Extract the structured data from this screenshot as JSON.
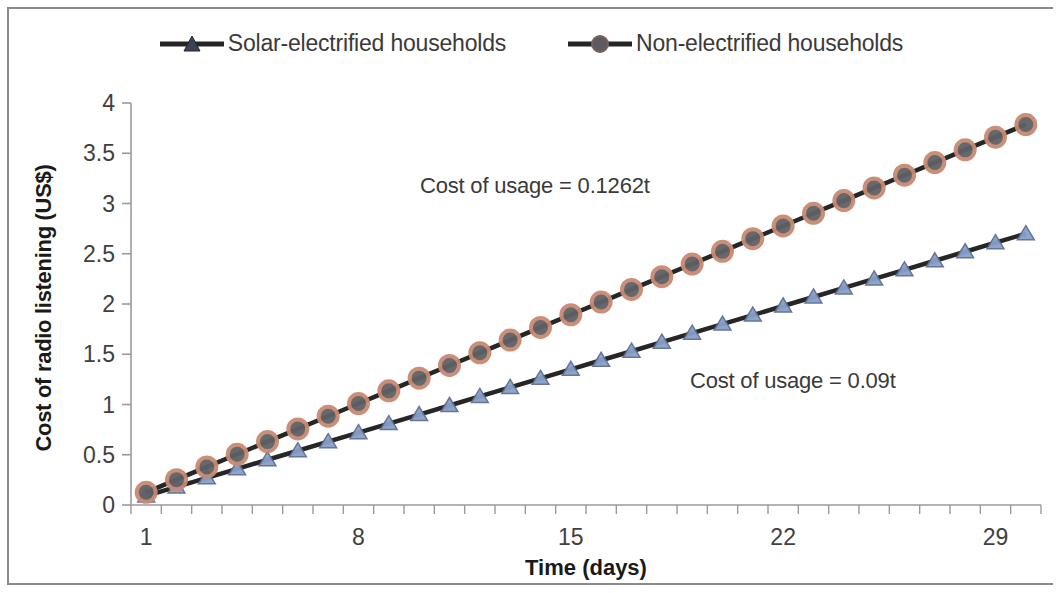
{
  "chart_data": {
    "type": "line",
    "title": "",
    "xlabel": "Time (days)",
    "ylabel": "Cost of radio listening (US$)",
    "xlim": [
      1,
      30
    ],
    "ylim": [
      0,
      4
    ],
    "ytick_step": 0.5,
    "yticks": [
      "0",
      "0.5",
      "1",
      "1.5",
      "2",
      "2.5",
      "3",
      "3.5",
      "4"
    ],
    "xticks_major": [
      "1",
      "8",
      "15",
      "22",
      "29"
    ],
    "x": [
      1,
      2,
      3,
      4,
      5,
      6,
      7,
      8,
      9,
      10,
      11,
      12,
      13,
      14,
      15,
      16,
      17,
      18,
      19,
      20,
      21,
      22,
      23,
      24,
      25,
      26,
      27,
      28,
      29,
      30
    ],
    "grid": false,
    "legend_position": "top",
    "series": [
      {
        "name": "Solar-electrified households",
        "marker": "triangle",
        "marker_color": "#8aa0c8",
        "line_color": "#262626",
        "slope": 0.09,
        "values": [
          0.09,
          0.18,
          0.27,
          0.36,
          0.45,
          0.54,
          0.63,
          0.72,
          0.81,
          0.9,
          0.99,
          1.08,
          1.17,
          1.26,
          1.35,
          1.44,
          1.53,
          1.62,
          1.71,
          1.8,
          1.89,
          1.98,
          2.07,
          2.16,
          2.25,
          2.34,
          2.43,
          2.52,
          2.61,
          2.7
        ]
      },
      {
        "name": "Non-electrified households",
        "marker": "circle",
        "marker_color": "#c98a72",
        "line_color": "#262626",
        "slope": 0.1262,
        "values": [
          0.1262,
          0.2524,
          0.3786,
          0.5048,
          0.631,
          0.7572,
          0.8834,
          1.0096,
          1.1358,
          1.262,
          1.3882,
          1.5144,
          1.6406,
          1.7668,
          1.893,
          2.0192,
          2.1454,
          2.2716,
          2.3978,
          2.524,
          2.6502,
          2.7764,
          2.9026,
          3.0288,
          3.155,
          3.2812,
          3.4074,
          3.5336,
          3.6598,
          3.786
        ]
      }
    ],
    "annotations": [
      {
        "text": "Cost of usage = 0.1262t",
        "series": "Non-electrified households"
      },
      {
        "text": "Cost of usage = 0.09t",
        "series": "Solar-electrified households"
      }
    ]
  },
  "legend": {
    "items": [
      {
        "label": "Solar-electrified households",
        "marker": "triangle-marker-icon"
      },
      {
        "label": "Non-electrified households",
        "marker": "circle-marker-icon"
      }
    ]
  },
  "colors": {
    "axis": "#9a9a9a",
    "text": "#3a3a3a",
    "line": "#262626",
    "triangle_marker": "#8aa0c8",
    "triangle_marker_edge": "#5d6f93",
    "circle_marker": "#c98a72",
    "circle_marker_edge": "#4a4a4a",
    "border": "#8b8b8b",
    "background": "#ffffff"
  }
}
